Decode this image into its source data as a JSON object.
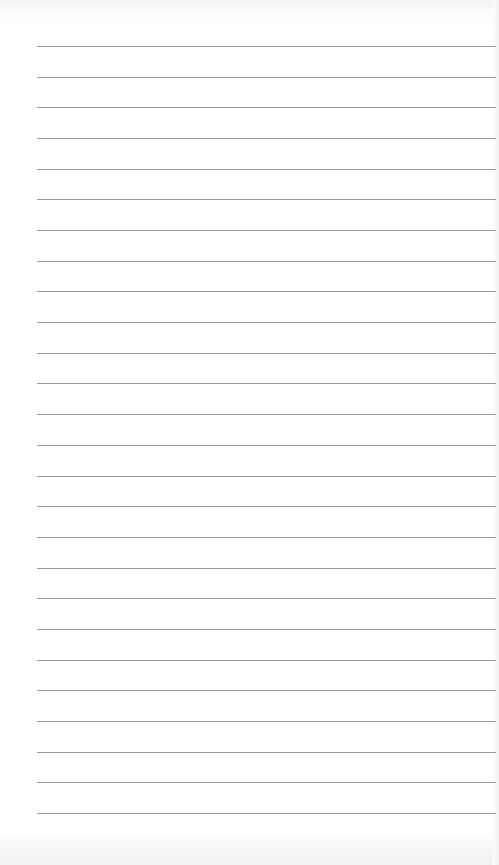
{
  "page": {
    "type": "lined-paper",
    "background_color": "#ffffff",
    "line_color": "#9a9a9a",
    "line_count": 26,
    "first_line_y": 46,
    "line_spacing": 30.68,
    "line_left": 37,
    "line_right": 496
  }
}
